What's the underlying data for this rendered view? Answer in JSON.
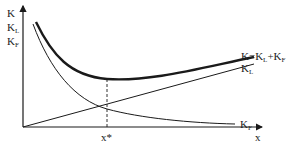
{
  "diagram": {
    "y_axis_labels": [
      {
        "main": "K",
        "sub": ""
      },
      {
        "main": "K",
        "sub": "L"
      },
      {
        "main": "K",
        "sub": "F"
      }
    ],
    "x_axis_label": "x",
    "optimum_label": "x*",
    "curves": [
      {
        "id": "total",
        "label_main": "K=K",
        "label_sub1": "L",
        "label_plus": "+K",
        "label_sub2": "F",
        "style": "thick"
      },
      {
        "id": "KL",
        "label_main": "K",
        "label_sub": "L",
        "style": "thin",
        "shape": "increasing-linear"
      },
      {
        "id": "KF",
        "label_main": "K",
        "label_sub": "F",
        "style": "thin",
        "shape": "decreasing-convex"
      }
    ],
    "colors": {
      "line": "#1a1a1a",
      "background": "#ffffff"
    }
  }
}
